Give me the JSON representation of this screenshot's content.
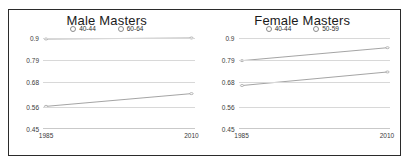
{
  "chart_data": [
    {
      "type": "line",
      "title": "Male Masters",
      "xlabel": "",
      "ylabel": "",
      "x": [
        1985,
        2010
      ],
      "xlim": [
        1985,
        2010
      ],
      "xticks": [
        "1985",
        "2010"
      ],
      "ylim": [
        0.45,
        0.9
      ],
      "yticks": [
        "0.9",
        "0.79",
        "0.68",
        "0.56",
        "0.45"
      ],
      "ytick_values": [
        0.9,
        0.79,
        0.68,
        0.56,
        0.45
      ],
      "grid": true,
      "legend_position": "top-center",
      "series": [
        {
          "name": "40-44",
          "values": [
            0.895,
            0.9
          ]
        },
        {
          "name": "60-64",
          "values": [
            0.562,
            0.625
          ]
        }
      ]
    },
    {
      "type": "line",
      "title": "Female Masters",
      "xlabel": "",
      "ylabel": "",
      "x": [
        1985,
        2010
      ],
      "xlim": [
        1985,
        2010
      ],
      "xticks": [
        "1985",
        "2010"
      ],
      "ylim": [
        0.45,
        0.9
      ],
      "yticks": [
        "0.9",
        "0.79",
        "0.68",
        "0.56",
        "0.45"
      ],
      "ytick_values": [
        0.9,
        0.79,
        0.68,
        0.56,
        0.45
      ],
      "grid": true,
      "legend_position": "top-center",
      "series": [
        {
          "name": "40-44",
          "values": [
            0.788,
            0.852
          ]
        },
        {
          "name": "50-59",
          "values": [
            0.665,
            0.732
          ]
        }
      ]
    }
  ],
  "style": {
    "border_color": "#2b2b2b",
    "grid_color": "#d8d8d8",
    "line_color": "#9a9a9a",
    "text_color": "#1a1a1a",
    "background": "#ffffff"
  }
}
